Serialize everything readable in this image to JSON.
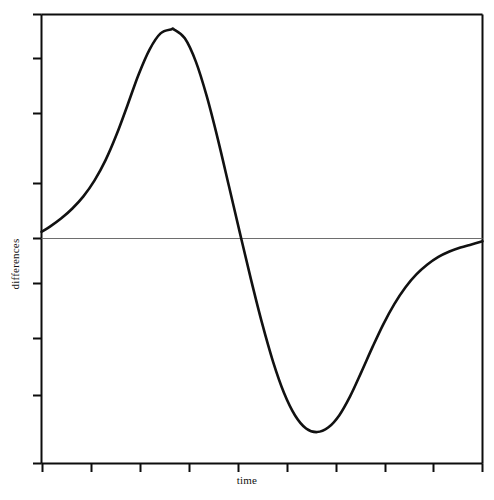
{
  "chart_data": {
    "type": "line",
    "title": "",
    "subtitle": "",
    "xlabel": "time",
    "ylabel": "differences",
    "grid": false,
    "legend": null,
    "legend_position": "none",
    "annotations": [],
    "xlim": [
      0,
      10
    ],
    "ylim": [
      -5,
      5
    ],
    "xticks": [
      0,
      1,
      2,
      3,
      4,
      5,
      6,
      7,
      8,
      9,
      10
    ],
    "yticks": [
      -4,
      -3,
      -2,
      -1,
      0,
      1,
      2,
      3,
      4
    ],
    "xticklabels": [],
    "yticklabels": [],
    "zero_line": 0,
    "series": [
      {
        "name": "differences",
        "color": "#111111",
        "x": [
          0.0,
          0.2,
          0.45,
          0.7,
          0.95,
          1.2,
          1.45,
          1.7,
          1.95,
          2.2,
          2.45,
          2.7,
          2.95,
          3.0,
          3.25,
          3.5,
          3.75,
          4.0,
          4.25,
          4.5,
          4.75,
          5.0,
          5.25,
          5.5,
          5.75,
          6.0,
          6.25,
          6.5,
          6.75,
          7.0,
          7.25,
          7.5,
          7.75,
          8.0,
          8.25,
          8.5,
          8.75,
          9.0,
          9.25,
          9.5,
          9.75,
          10.0
        ],
        "y": [
          0.16,
          0.28,
          0.46,
          0.68,
          0.95,
          1.3,
          1.75,
          2.32,
          2.98,
          3.66,
          4.22,
          4.58,
          4.67,
          4.67,
          4.47,
          3.95,
          3.17,
          2.22,
          1.18,
          0.13,
          -0.9,
          -1.87,
          -2.73,
          -3.43,
          -3.93,
          -4.22,
          -4.3,
          -4.2,
          -3.93,
          -3.5,
          -2.97,
          -2.42,
          -1.9,
          -1.45,
          -1.08,
          -0.79,
          -0.57,
          -0.4,
          -0.28,
          -0.19,
          -0.12,
          -0.05
        ],
        "peak": {
          "x": 2.95,
          "y": 4.67
        },
        "trough": {
          "x": 6.25,
          "y": -4.3
        },
        "zero_crossing": {
          "x": 4.53,
          "y": 0.0
        },
        "start": {
          "x": 0.0,
          "y": 0.16
        },
        "end": {
          "x": 10.0,
          "y": -0.05
        }
      }
    ],
    "colors": {
      "curve": "#111111",
      "frame": "#0d0d0d",
      "zero_line": "#6e6e6e",
      "background": "#ffffff",
      "text": "#111111"
    }
  }
}
